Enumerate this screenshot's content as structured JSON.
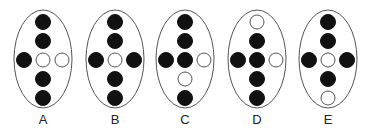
{
  "colors": {
    "stroke": "#555555",
    "filled": "#111111",
    "empty": "#ffffff",
    "background": "#ffffff"
  },
  "layout": {
    "positions": [
      "top",
      "upper",
      "left",
      "center",
      "right",
      "lower",
      "bottom"
    ]
  },
  "figures": [
    {
      "label": "A",
      "cx": 43,
      "dots": {
        "top": "filled",
        "upper": "filled",
        "left": "filled",
        "center": "empty",
        "right": "empty",
        "lower": "filled",
        "bottom": "filled"
      }
    },
    {
      "label": "B",
      "cx": 115,
      "dots": {
        "top": "filled",
        "upper": "filled",
        "left": "filled",
        "center": "empty",
        "right": "filled",
        "lower": "filled",
        "bottom": "filled"
      }
    },
    {
      "label": "C",
      "cx": 185,
      "dots": {
        "top": "filled",
        "upper": "filled",
        "left": "filled",
        "center": "filled",
        "right": "empty",
        "lower": "empty",
        "bottom": "filled"
      }
    },
    {
      "label": "D",
      "cx": 257,
      "dots": {
        "top": "empty",
        "upper": "filled",
        "left": "filled",
        "center": "filled",
        "right": "empty",
        "lower": "filled",
        "bottom": "filled"
      }
    },
    {
      "label": "E",
      "cx": 328,
      "dots": {
        "top": "filled",
        "upper": "filled",
        "left": "filled",
        "center": "empty",
        "right": "filled",
        "lower": "filled",
        "bottom": "empty"
      }
    }
  ]
}
